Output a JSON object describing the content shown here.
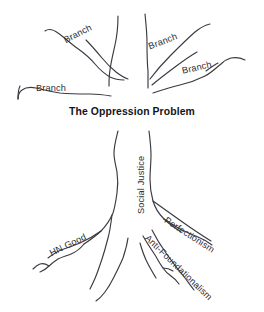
{
  "diagram": {
    "title": "The Oppression Problem",
    "kind": "hand-drawn-tree-diagram",
    "stroke_color": "#3a3a42",
    "text_color": "#2e2e34",
    "background_color": "#ffffff"
  },
  "branches": [
    {
      "id": "branch-upper-left",
      "label": "Branch",
      "x": 62,
      "y": 36,
      "rotation": -27
    },
    {
      "id": "branch-upper-right",
      "label": "Branch",
      "x": 147,
      "y": 42,
      "rotation": -21
    },
    {
      "id": "branch-mid-right",
      "label": "Branch",
      "x": 181,
      "y": 66,
      "rotation": -13
    },
    {
      "id": "branch-left",
      "label": "Branch",
      "x": 36,
      "y": 83,
      "rotation": 0
    }
  ],
  "trunk": {
    "id": "trunk-social-justice",
    "label": "Social Justice",
    "x": 136,
    "y": 214,
    "rotation": -90
  },
  "roots": [
    {
      "id": "root-hn-good",
      "label": "HN Good",
      "x": 48,
      "y": 249,
      "rotation": -26
    },
    {
      "id": "root-perfectionism",
      "label": "Perfectionism",
      "x": 168,
      "y": 215,
      "rotation": 33
    },
    {
      "id": "root-anti-foundationalism",
      "label": "Anti-Foundationalism",
      "x": 150,
      "y": 233,
      "rotation": 44
    }
  ]
}
